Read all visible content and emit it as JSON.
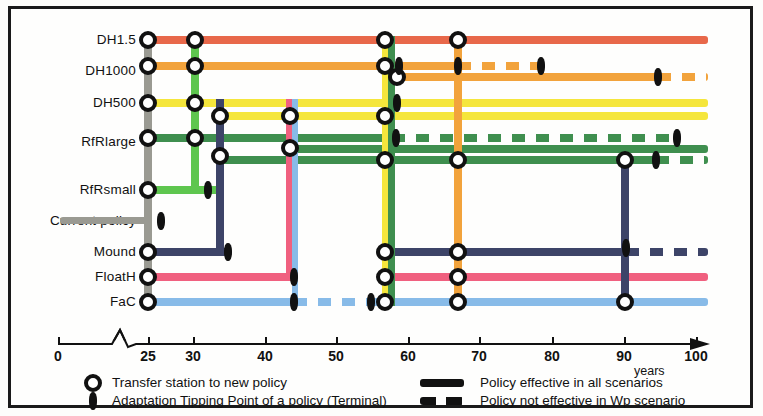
{
  "chart_data": {
    "type": "line",
    "xlabel": "years",
    "x_ticks": [
      0,
      25,
      30,
      40,
      50,
      60,
      70,
      80,
      90,
      100
    ],
    "x_axis_break_after": 0,
    "xlim": [
      0,
      100
    ],
    "ylabel": "",
    "grid": false,
    "legend_position": "bottom",
    "categories": [
      "DH1.5",
      "DH1000",
      "DH500",
      "RfRlarge",
      "RfRsmall",
      "Current policy",
      "Mound",
      "FloatH",
      "FaC"
    ],
    "series": [
      {
        "name": "DH1.5",
        "color": "#e8684a",
        "start_year": 25,
        "end_year": 100,
        "solid_to": 100,
        "transfer_stations": [
          25,
          31,
          57,
          66
        ],
        "tipping_points": []
      },
      {
        "name": "DH1000",
        "color": "#f2a33c",
        "start_year": 25,
        "end_year": 100,
        "solid_to": 82,
        "transfer_stations": [
          25,
          31,
          56,
          58
        ],
        "tipping_points": [
          57,
          78,
          90
        ],
        "dashed_after": 90
      },
      {
        "name": "DH500",
        "color": "#f5e63c",
        "start_year": 25,
        "end_year": 100,
        "solid_to": 100,
        "transfer_stations": [
          25,
          31,
          34,
          44,
          57
        ],
        "tipping_points": [
          60
        ]
      },
      {
        "name": "RfRlarge",
        "color": "#3f8f4f",
        "start_year": 25,
        "end_year": 100,
        "solid_to": 100,
        "transfer_stations": [
          25,
          31,
          34,
          44,
          57,
          66,
          89
        ],
        "tipping_points": [
          58,
          90,
          92
        ]
      },
      {
        "name": "RfRsmall",
        "color": "#5ec64f",
        "start_year": 25,
        "end_year": 34,
        "solid_to": 34,
        "transfer_stations": [
          25
        ],
        "tipping_points": [
          34
        ]
      },
      {
        "name": "Current policy",
        "color": "#9a9a92",
        "start_year": 13,
        "end_year": 26,
        "solid_to": 26,
        "transfer_stations": [],
        "tipping_points": [
          26
        ]
      },
      {
        "name": "Mound",
        "color": "#3d4468",
        "start_year": 25,
        "end_year": 100,
        "solid_to": 90,
        "transfer_stations": [
          25,
          57,
          66
        ],
        "tipping_points": [
          35,
          90
        ],
        "dashed_after": 90
      },
      {
        "name": "FloatH",
        "color": "#f0607f",
        "start_year": 25,
        "end_year": 100,
        "solid_to": 100,
        "transfer_stations": [
          25,
          57,
          66
        ],
        "tipping_points": [
          44
        ]
      },
      {
        "name": "FaC",
        "color": "#88bbe8",
        "start_year": 25,
        "end_year": 100,
        "solid_to": 100,
        "transfer_stations": [
          25,
          57,
          66,
          89
        ],
        "tipping_points": [
          44,
          55
        ]
      }
    ]
  },
  "axis": {
    "label": "years",
    "ticks": [
      {
        "value": "0",
        "x": 58
      },
      {
        "value": "25",
        "x": 148
      },
      {
        "value": "30",
        "x": 193
      },
      {
        "value": "40",
        "x": 265
      },
      {
        "value": "50",
        "x": 336
      },
      {
        "value": "60",
        "x": 408
      },
      {
        "value": "70",
        "x": 479
      },
      {
        "value": "80",
        "x": 552
      },
      {
        "value": "90",
        "x": 624
      },
      {
        "value": "100",
        "x": 696
      }
    ]
  },
  "rows": [
    {
      "label": "DH1.5",
      "y": 40
    },
    {
      "label": "DH1000",
      "y": 71
    },
    {
      "label": "DH500",
      "y": 103
    },
    {
      "label": "RfRlarge",
      "y": 142
    },
    {
      "label": "RfRsmall",
      "y": 190
    },
    {
      "label": "Current policy",
      "y": 221
    },
    {
      "label": "Mound",
      "y": 252
    },
    {
      "label": "FloatH",
      "y": 277
    },
    {
      "label": "FaC",
      "y": 302
    }
  ],
  "legend": {
    "items": [
      {
        "glyph": "station",
        "text": "Transfer station to new policy"
      },
      {
        "glyph": "tipping",
        "text": "Adaptation Tipping Point of a policy (Terminal)"
      },
      {
        "glyph": "solid",
        "text": "Policy effective in all scenarios"
      },
      {
        "glyph": "dashed",
        "text": "Policy not effective in Wp scenario"
      }
    ]
  },
  "segments": [
    {
      "n": "dh15-main",
      "c": "#e8684a",
      "x": 146,
      "y": 36,
      "w": 562,
      "h": 8,
      "d": false
    },
    {
      "n": "dh1000-a",
      "c": "#f2a33c",
      "x": 146,
      "y": 62,
      "w": 314,
      "h": 8,
      "d": false
    },
    {
      "n": "dh1000-a-dash",
      "c": "#f2a33c",
      "x": 458,
      "y": 62,
      "w": 84,
      "h": 8,
      "d": true
    },
    {
      "n": "dh1000-b",
      "c": "#f2a33c",
      "x": 386,
      "y": 73,
      "w": 275,
      "h": 8,
      "d": false
    },
    {
      "n": "dh1000-b-dash",
      "c": "#f2a33c",
      "x": 658,
      "y": 73,
      "w": 50,
      "h": 8,
      "d": true
    },
    {
      "n": "dh500-a",
      "c": "#f5e63c",
      "x": 146,
      "y": 99,
      "w": 562,
      "h": 8,
      "d": false
    },
    {
      "n": "dh500-b",
      "c": "#f5e63c",
      "x": 218,
      "y": 112,
      "w": 490,
      "h": 8,
      "d": false
    },
    {
      "n": "rfrl-a",
      "c": "#3f8f4f",
      "x": 146,
      "y": 134,
      "w": 248,
      "h": 8,
      "d": false
    },
    {
      "n": "rfrl-a-dash",
      "c": "#3f8f4f",
      "x": 392,
      "y": 134,
      "w": 288,
      "h": 8,
      "d": true
    },
    {
      "n": "rfrl-b",
      "c": "#3f8f4f",
      "x": 288,
      "y": 145,
      "w": 420,
      "h": 8,
      "d": false
    },
    {
      "n": "rfrl-c",
      "c": "#3f8f4f",
      "x": 218,
      "y": 156,
      "w": 438,
      "h": 8,
      "d": false
    },
    {
      "n": "rfrl-c-dash",
      "c": "#3f8f4f",
      "x": 656,
      "y": 156,
      "w": 52,
      "h": 8,
      "d": true
    },
    {
      "n": "rfrs-main",
      "c": "#5ec64f",
      "x": 146,
      "y": 186,
      "w": 76,
      "h": 8,
      "d": false
    },
    {
      "n": "current-main",
      "c": "#9a9a92",
      "x": 60,
      "y": 217,
      "w": 92,
      "h": 7,
      "d": false
    },
    {
      "n": "mound-a",
      "c": "#3d4468",
      "x": 146,
      "y": 248,
      "w": 82,
      "h": 8,
      "d": false
    },
    {
      "n": "mound-b",
      "c": "#3d4468",
      "x": 386,
      "y": 248,
      "w": 240,
      "h": 8,
      "d": false
    },
    {
      "n": "mound-b-dash",
      "c": "#3d4468",
      "x": 626,
      "y": 248,
      "w": 82,
      "h": 8,
      "d": true
    },
    {
      "n": "floath-a",
      "c": "#f0607f",
      "x": 146,
      "y": 273,
      "w": 148,
      "h": 8,
      "d": false
    },
    {
      "n": "floath-b",
      "c": "#f0607f",
      "x": 386,
      "y": 273,
      "w": 322,
      "h": 8,
      "d": false
    },
    {
      "n": "fac-a",
      "c": "#88bbe8",
      "x": 146,
      "y": 298,
      "w": 148,
      "h": 8,
      "d": false
    },
    {
      "n": "fac-a-dash",
      "c": "#88bbe8",
      "x": 294,
      "y": 298,
      "w": 92,
      "h": 8,
      "d": true
    },
    {
      "n": "fac-b",
      "c": "#88bbe8",
      "x": 386,
      "y": 298,
      "w": 322,
      "h": 8,
      "d": false
    }
  ],
  "verticals": [
    {
      "n": "v-gray-25",
      "c": "#9a9a92",
      "x": 144,
      "y": 36,
      "w": 8,
      "h": 270
    },
    {
      "n": "v-green-31",
      "c": "#5ec64f",
      "x": 191,
      "y": 36,
      "w": 8,
      "h": 154
    },
    {
      "n": "v-navy-34",
      "c": "#3d4468",
      "x": 216,
      "y": 99,
      "w": 8,
      "h": 157
    },
    {
      "n": "v-pink-44",
      "c": "#f0607f",
      "x": 286,
      "y": 99,
      "w": 6,
      "h": 178
    },
    {
      "n": "v-blue-44",
      "c": "#88bbe8",
      "x": 292,
      "y": 99,
      "w": 6,
      "h": 203
    },
    {
      "n": "v-yellow-57",
      "c": "#f5e63c",
      "x": 382,
      "y": 36,
      "w": 7,
      "h": 270
    },
    {
      "n": "v-green-57",
      "c": "#3f8f4f",
      "x": 388,
      "y": 36,
      "w": 7,
      "h": 270
    },
    {
      "n": "v-orange-66",
      "c": "#f2a33c",
      "x": 454,
      "y": 36,
      "w": 8,
      "h": 270
    },
    {
      "n": "v-navy-89",
      "c": "#3d4468",
      "x": 621,
      "y": 156,
      "w": 8,
      "h": 150
    }
  ],
  "stations": [
    {
      "x": 148,
      "y": 40
    },
    {
      "x": 148,
      "y": 66
    },
    {
      "x": 148,
      "y": 103
    },
    {
      "x": 148,
      "y": 138
    },
    {
      "x": 148,
      "y": 190
    },
    {
      "x": 148,
      "y": 252
    },
    {
      "x": 148,
      "y": 277
    },
    {
      "x": 148,
      "y": 302
    },
    {
      "x": 195,
      "y": 40
    },
    {
      "x": 195,
      "y": 66
    },
    {
      "x": 195,
      "y": 103
    },
    {
      "x": 195,
      "y": 138
    },
    {
      "x": 220,
      "y": 116
    },
    {
      "x": 220,
      "y": 156
    },
    {
      "x": 290,
      "y": 116
    },
    {
      "x": 290,
      "y": 148
    },
    {
      "x": 385,
      "y": 40
    },
    {
      "x": 385,
      "y": 66
    },
    {
      "x": 385,
      "y": 116
    },
    {
      "x": 385,
      "y": 160
    },
    {
      "x": 385,
      "y": 252
    },
    {
      "x": 385,
      "y": 277
    },
    {
      "x": 385,
      "y": 302
    },
    {
      "x": 397,
      "y": 77
    },
    {
      "x": 458,
      "y": 40
    },
    {
      "x": 458,
      "y": 160
    },
    {
      "x": 458,
      "y": 252
    },
    {
      "x": 458,
      "y": 277
    },
    {
      "x": 458,
      "y": 302
    },
    {
      "x": 625,
      "y": 160
    },
    {
      "x": 625,
      "y": 302
    }
  ],
  "tips": [
    {
      "x": 208,
      "y": 190
    },
    {
      "x": 161,
      "y": 221
    },
    {
      "x": 228,
      "y": 252
    },
    {
      "x": 294,
      "y": 277
    },
    {
      "x": 294,
      "y": 302
    },
    {
      "x": 371,
      "y": 302
    },
    {
      "x": 397,
      "y": 103
    },
    {
      "x": 396,
      "y": 138
    },
    {
      "x": 399,
      "y": 66
    },
    {
      "x": 458,
      "y": 66
    },
    {
      "x": 541,
      "y": 66
    },
    {
      "x": 658,
      "y": 77
    },
    {
      "x": 677,
      "y": 138
    },
    {
      "x": 656,
      "y": 160
    },
    {
      "x": 626,
      "y": 248
    }
  ]
}
